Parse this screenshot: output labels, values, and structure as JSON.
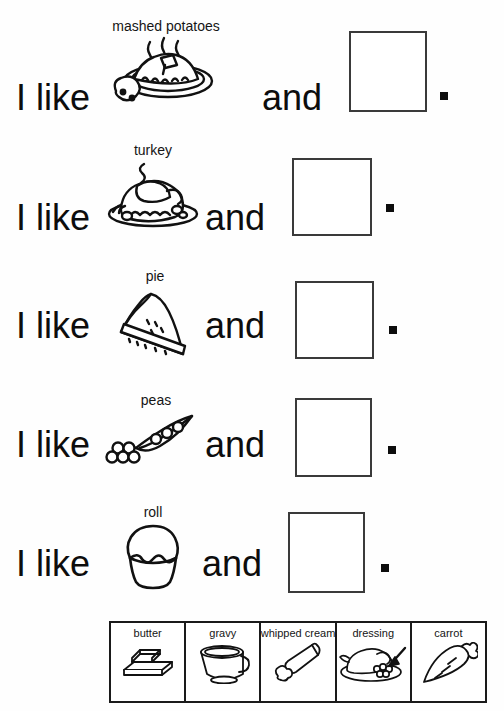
{
  "page": {
    "background_color": "#ffffff",
    "ink_color": "#111111"
  },
  "sentences": [
    {
      "prefix": "I like",
      "picture_label": "mashed potatoes",
      "picture_icon": "mashed-potatoes-icon",
      "conjunction": "and",
      "answer_value": "",
      "terminator": "."
    },
    {
      "prefix": "I like",
      "picture_label": "turkey",
      "picture_icon": "roast-turkey-icon",
      "conjunction": "and",
      "answer_value": "",
      "terminator": "."
    },
    {
      "prefix": "I like",
      "picture_label": "pie",
      "picture_icon": "pie-slice-icon",
      "conjunction": "and",
      "answer_value": "",
      "terminator": "."
    },
    {
      "prefix": "I like",
      "picture_label": "peas",
      "picture_icon": "pea-pod-icon",
      "conjunction": "and",
      "answer_value": "",
      "terminator": "."
    },
    {
      "prefix": "I like",
      "picture_label": "roll",
      "picture_icon": "dinner-roll-icon",
      "conjunction": "and",
      "answer_value": "",
      "terminator": "."
    }
  ],
  "word_bank": {
    "cells": [
      {
        "label": "butter",
        "icon": "butter-dish-icon"
      },
      {
        "label": "gravy",
        "icon": "gravy-boat-icon"
      },
      {
        "label": "whipped cream",
        "icon": "whipped-cream-can-icon"
      },
      {
        "label": "dressing",
        "icon": "dressing-platter-icon"
      },
      {
        "label": "carrot",
        "icon": "carrot-icon"
      }
    ]
  }
}
